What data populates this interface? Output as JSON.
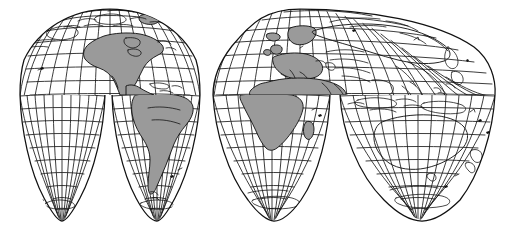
{
  "figure": {
    "name": "interrupted-world-map",
    "projection_type": "interrupted-homolosine",
    "background_color": "#ffffff",
    "line_color": "#111111",
    "land_fill_color": "#9a9a9a",
    "width_px": 511,
    "height_px": 237
  },
  "graticule": {
    "meridian_interval_degrees": 10,
    "parallel_interval_degrees": 10,
    "equator_y_px": 95,
    "north_pole_row_y_px": 9,
    "south_lobe_tip_y_px": 221,
    "grid_visible": true
  },
  "lobes": {
    "northern": [
      {
        "id": "north-lobe-western",
        "label": "Americas (north)",
        "center_lon": -100,
        "x_start_px": 20,
        "x_end_px": 200
      },
      {
        "id": "north-lobe-eastern",
        "label": "Eurasia / Africa (north)",
        "center_lon": 40,
        "x_start_px": 213,
        "x_end_px": 495
      }
    ],
    "southern": [
      {
        "id": "south-lobe-1",
        "label": "Eastern Pacific",
        "center_lon": -160,
        "x_start_px": 20,
        "x_end_px": 105
      },
      {
        "id": "south-lobe-2",
        "label": "South America",
        "center_lon": -60,
        "x_start_px": 112,
        "x_end_px": 200
      },
      {
        "id": "south-lobe-3",
        "label": "Africa / Indian Ocean",
        "center_lon": 20,
        "x_start_px": 213,
        "x_end_px": 330
      },
      {
        "id": "south-lobe-4",
        "label": "Australia / Oceania",
        "center_lon": 140,
        "x_start_px": 340,
        "x_end_px": 495
      }
    ]
  },
  "landmasses": {
    "shaded": [
      {
        "id": "north-america",
        "label": "North America"
      },
      {
        "id": "central-america",
        "label": "Central America"
      },
      {
        "id": "south-america",
        "label": "South America"
      },
      {
        "id": "greenland",
        "label": "Greenland"
      },
      {
        "id": "europe",
        "label": "Europe"
      },
      {
        "id": "africa",
        "label": "Africa"
      },
      {
        "id": "madagascar",
        "label": "Madagascar"
      },
      {
        "id": "arabia",
        "label": "Arabian Peninsula"
      }
    ],
    "outline_only": [
      {
        "id": "asia",
        "label": "Asia"
      },
      {
        "id": "india",
        "label": "India"
      },
      {
        "id": "southeast-asia",
        "label": "Southeast Asia"
      },
      {
        "id": "indonesia",
        "label": "Indonesia"
      },
      {
        "id": "australia",
        "label": "Australia"
      },
      {
        "id": "new-guinea",
        "label": "New Guinea"
      },
      {
        "id": "new-zealand",
        "label": "New Zealand"
      },
      {
        "id": "japan",
        "label": "Japan"
      },
      {
        "id": "philippines",
        "label": "Philippines"
      },
      {
        "id": "antarctica-fringe",
        "label": "Antarctic fringe"
      }
    ]
  }
}
